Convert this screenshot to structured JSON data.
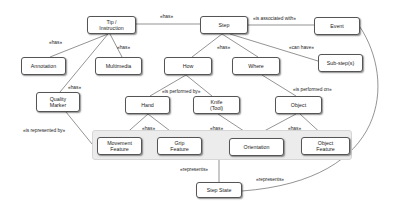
{
  "diagram": {
    "nodes": {
      "tip": "Tip /\nInstruction",
      "step": "Step",
      "event": "Event",
      "annotation": "Annotation",
      "multimedia": "Multimedia",
      "how": "How",
      "where": "Where",
      "substeps": "Sub-step(s)",
      "quality_marker": "Quality\nMarker",
      "hand": "Hand",
      "knife": "Knife\n(Tool)",
      "object": "Object",
      "movement_feature": "Movement\nFeature",
      "grip_feature": "Grip\nFeature",
      "orientation": "Orientation",
      "object_feature": "Object\nFeature",
      "step_state": "Step State"
    },
    "edge_labels": {
      "tip_step": "«has»",
      "step_event": "«is associated with»",
      "tip_annotation": "«has»",
      "tip_multimedia": "«has»",
      "tip_quality": "«has»",
      "step_howwhere": "«has»",
      "step_substeps": "«can have»",
      "how_handknife": "«is performed by»",
      "where_object": "«is performed on»",
      "quality_features": "«is represented by»",
      "hand_features": "«has»",
      "knife_orientation": "«has»",
      "object_features": "«has»",
      "features_stepstate": "«represents»",
      "event_stepstate": "«represents»"
    }
  }
}
